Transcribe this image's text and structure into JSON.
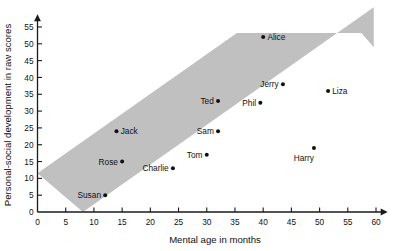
{
  "chart_data": {
    "type": "scatter",
    "title": "",
    "xlabel": "Mental age in months",
    "ylabel": "Personal-social development in raw scores",
    "xlim": [
      0,
      61
    ],
    "ylim": [
      0,
      57
    ],
    "xticks": [
      0,
      5,
      10,
      15,
      20,
      25,
      30,
      35,
      40,
      45,
      50,
      55,
      60
    ],
    "yticks": [
      0,
      5,
      10,
      15,
      20,
      25,
      30,
      35,
      40,
      45,
      50,
      55
    ],
    "grid": false,
    "legend": "none",
    "points": [
      {
        "label": "Susan",
        "x": 12,
        "y": 5,
        "label_side": "left"
      },
      {
        "label": "Jack",
        "x": 14,
        "y": 24,
        "label_side": "right"
      },
      {
        "label": "Rose",
        "x": 15,
        "y": 15,
        "label_side": "left"
      },
      {
        "label": "Charlie",
        "x": 24,
        "y": 13,
        "label_side": "left"
      },
      {
        "label": "Tom",
        "x": 30,
        "y": 17,
        "label_side": "left"
      },
      {
        "label": "Sam",
        "x": 32,
        "y": 24,
        "label_side": "left"
      },
      {
        "label": "Ted",
        "x": 32,
        "y": 33,
        "label_side": "left"
      },
      {
        "label": "Phil",
        "x": 39.5,
        "y": 32.5,
        "label_side": "left"
      },
      {
        "label": "Alice",
        "x": 40,
        "y": 52,
        "label_side": "right"
      },
      {
        "label": "Jerry",
        "x": 43.5,
        "y": 38,
        "label_side": "left"
      },
      {
        "label": "Harry",
        "x": 49,
        "y": 19,
        "label_side": "below"
      },
      {
        "label": "Liza",
        "x": 51.5,
        "y": 36,
        "label_side": "right"
      }
    ],
    "band": {
      "description": "shaded normal-range band",
      "color": "#c0c0c0",
      "slope": 1.18,
      "lower_intercept": -9.5,
      "upper_intercept": 11.5
    },
    "annotations": []
  },
  "axis": {
    "x_title": "Mental age in months",
    "y_title": "Personal-social development in raw scores"
  }
}
